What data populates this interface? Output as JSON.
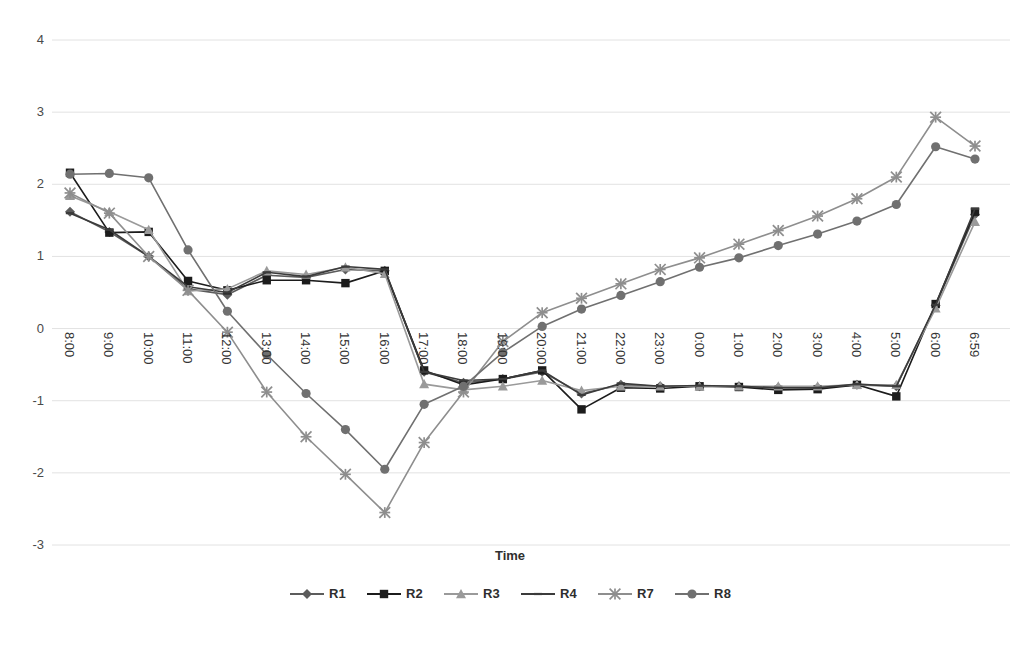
{
  "chart_data": {
    "type": "line",
    "title": "",
    "xlabel": "Time",
    "ylabel": "",
    "ylim": [
      -3,
      4
    ],
    "yticks": [
      4,
      3,
      2,
      1,
      0,
      -1,
      -2,
      -3
    ],
    "ytick_labels": [
      "4",
      "3",
      "2",
      "1",
      "0",
      "-1",
      "-2",
      "-3"
    ],
    "grid": true,
    "grid_axis": "y",
    "legend_position": "bottom",
    "categories": [
      "8:00",
      "9:00",
      "10:00",
      "11:00",
      "12:00",
      "13:00",
      "14:00",
      "15:00",
      "16:00",
      "17:00",
      "18:00",
      "19:00",
      "20:00",
      "21:00",
      "22:00",
      "23:00",
      "0:00",
      "1:00",
      "2:00",
      "3:00",
      "4:00",
      "5:00",
      "6:00",
      "6:59"
    ],
    "series": [
      {
        "name": "R1",
        "marker": "diamond",
        "color": "#5c5c5c",
        "values": [
          1.62,
          1.34,
          1.0,
          0.55,
          0.47,
          0.74,
          0.71,
          0.82,
          0.8,
          -0.6,
          -0.75,
          -0.7,
          -0.6,
          -0.9,
          -0.78,
          -0.8,
          -0.8,
          -0.8,
          -0.82,
          -0.82,
          -0.78,
          -0.8,
          0.32,
          1.58
        ]
      },
      {
        "name": "R2",
        "marker": "square",
        "color": "#1c1c1c",
        "values": [
          2.16,
          1.33,
          1.34,
          0.66,
          0.53,
          0.67,
          0.67,
          0.63,
          0.8,
          -0.58,
          -0.78,
          -0.7,
          -0.58,
          -1.12,
          -0.82,
          -0.83,
          -0.8,
          -0.81,
          -0.85,
          -0.84,
          -0.78,
          -0.94,
          0.34,
          1.62
        ]
      },
      {
        "name": "R3",
        "marker": "triangle",
        "color": "#9a9a9a",
        "values": [
          1.84,
          1.62,
          1.37,
          0.52,
          0.55,
          0.8,
          0.75,
          0.85,
          0.76,
          -0.77,
          -0.85,
          -0.8,
          -0.72,
          -0.86,
          -0.8,
          -0.8,
          -0.8,
          -0.8,
          -0.8,
          -0.8,
          -0.78,
          -0.78,
          0.28,
          1.48
        ]
      },
      {
        "name": "R4",
        "marker": "line",
        "color": "#3b3b3b",
        "values": [
          1.6,
          1.37,
          1.0,
          0.58,
          0.5,
          0.78,
          0.72,
          0.86,
          0.82,
          -0.6,
          -0.72,
          -0.7,
          -0.58,
          -0.92,
          -0.76,
          -0.8,
          -0.79,
          -0.8,
          -0.82,
          -0.82,
          -0.77,
          -0.8,
          0.33,
          1.66
        ]
      },
      {
        "name": "R7",
        "marker": "x",
        "color": "#8e8e8e",
        "values": [
          1.88,
          1.6,
          1.0,
          0.53,
          -0.05,
          -0.88,
          -1.5,
          -2.02,
          -2.55,
          -1.58,
          -0.88,
          -0.18,
          0.22,
          0.42,
          0.62,
          0.82,
          0.98,
          1.17,
          1.36,
          1.56,
          1.8,
          2.1,
          2.93,
          2.53
        ]
      },
      {
        "name": "R8",
        "marker": "circle",
        "color": "#707070",
        "values": [
          2.14,
          2.15,
          2.09,
          1.09,
          0.24,
          -0.36,
          -0.9,
          -1.4,
          -1.95,
          -1.05,
          -0.8,
          -0.33,
          0.03,
          0.27,
          0.46,
          0.65,
          0.85,
          0.98,
          1.15,
          1.31,
          1.49,
          1.72,
          2.52,
          2.35
        ]
      }
    ]
  },
  "legend": {
    "entries": [
      {
        "label": "R1"
      },
      {
        "label": "R2"
      },
      {
        "label": "R3"
      },
      {
        "label": "R4"
      },
      {
        "label": "R7"
      },
      {
        "label": "R8"
      }
    ]
  },
  "axis": {
    "x_title": "Time"
  }
}
